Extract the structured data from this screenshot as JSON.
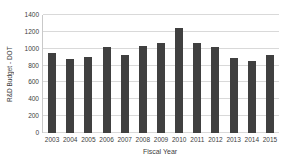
{
  "chart_data": {
    "type": "bar",
    "title": "",
    "xlabel": "Fiscal Year",
    "ylabel": "R&D Budget - DOT",
    "categories": [
      "2003",
      "2004",
      "2005",
      "2006",
      "2007",
      "2008",
      "2009",
      "2010",
      "2011",
      "2012",
      "2013",
      "2014",
      "2015"
    ],
    "values": [
      945,
      875,
      900,
      1015,
      920,
      1030,
      1070,
      1250,
      1070,
      1020,
      890,
      850,
      925
    ],
    "ylim": [
      0,
      1400
    ],
    "ytick_step": 200,
    "yticks": [
      "0",
      "200",
      "400",
      "600",
      "800",
      "1000",
      "1200",
      "1400"
    ],
    "grid": "horizontal",
    "legend": "none",
    "colors": {
      "bar": "#404040",
      "gridline": "#d9d9d9",
      "axis_line": "#c9c9c9",
      "text": "#404040",
      "background": "#ffffff"
    }
  }
}
